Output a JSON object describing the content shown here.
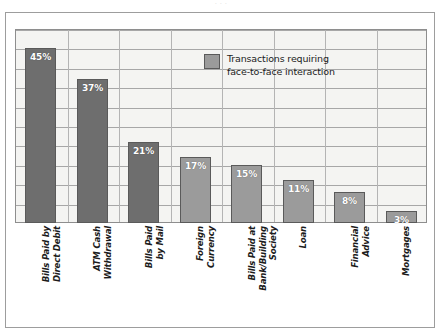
{
  "figure": {
    "top_cropped_text": "· · ·",
    "plot_background": "#f4f4f2",
    "frame_color": "#9d9d9d"
  },
  "legend": {
    "label": "Transactions requiring\nface-to-face interaction",
    "swatch_color": "#9b9b9b",
    "position": "inside-top-right"
  },
  "chart_data": {
    "type": "bar",
    "title": "",
    "subtitle": "",
    "xlabel": "",
    "ylabel": "",
    "ylim": [
      0,
      50
    ],
    "grid": true,
    "grid_step": 5,
    "legend": [
      "Transactions requiring face-to-face interaction"
    ],
    "legend_position": "inside-top-right",
    "value_suffix": "%",
    "categories": [
      "Bills Paid by\nDirect Debit",
      "ATM Cash\nWithdrawal",
      "Bills Paid\nby Mail",
      "Foreign\nCurrency",
      "Bills Paid at\nBank/Building\nSociety",
      "Loan",
      "Financial\nAdvice",
      "Mortgages"
    ],
    "values": [
      45,
      37,
      21,
      17,
      15,
      11,
      8,
      3
    ],
    "value_labels": [
      "45%",
      "37%",
      "21%",
      "17%",
      "15%",
      "11%",
      "8%",
      "3%"
    ],
    "bar_colors": [
      "#6e6e6e",
      "#6e6e6e",
      "#6e6e6e",
      "#9b9b9b",
      "#9b9b9b",
      "#9b9b9b",
      "#9b9b9b",
      "#9b9b9b"
    ],
    "bar_shades": [
      "dark",
      "dark",
      "dark",
      "light",
      "light",
      "light",
      "light",
      "light"
    ],
    "bar_edge_color": "#5a5a5a"
  }
}
